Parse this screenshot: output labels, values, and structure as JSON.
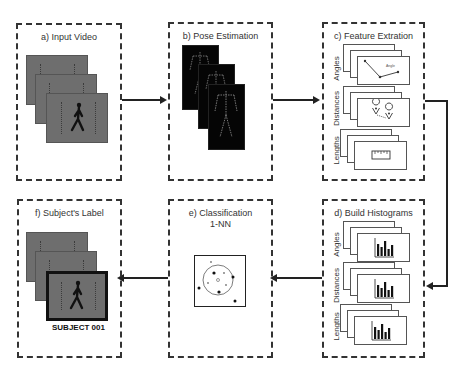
{
  "panels": {
    "a": {
      "title": "a) Input Video"
    },
    "b": {
      "title": "b) Pose Estimation"
    },
    "c": {
      "title": "c) Feature Extration",
      "rows": [
        "Angles",
        "Distances",
        "Lengths"
      ],
      "angle_annotation": "Angle"
    },
    "d": {
      "title": "d) Build Histograms",
      "rows": [
        "Angles",
        "Distances",
        "Lengths"
      ]
    },
    "e": {
      "title": "e) Classification",
      "subtitle": "1-NN"
    },
    "f": {
      "title": "f) Subject's Label",
      "label": "SUBJECT 001"
    }
  },
  "flow": [
    "a",
    "b",
    "c",
    "d",
    "e",
    "f"
  ],
  "colors": {
    "border": "#333333",
    "frame_bg": "#6e6e6e",
    "skeleton_bg": "#050505",
    "arrow": "#222222"
  }
}
